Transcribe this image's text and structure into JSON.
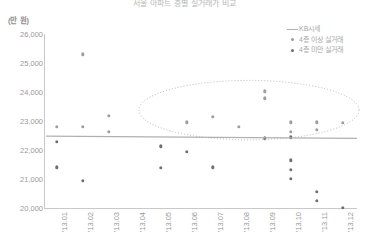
{
  "chart_data": {
    "type": "scatter",
    "title": "서울 아파트 층별 실거래가 비교",
    "unit_label": "(만 원)",
    "xlabel": "",
    "ylabel": "",
    "ylim": [
      20000,
      26000
    ],
    "ytick_values": [
      26000,
      25000,
      24000,
      23000,
      22000,
      21000,
      20000
    ],
    "ytick_labels": [
      "26,000",
      "25,000",
      "24,000",
      "23,000",
      "22,000",
      "21,000",
      "20,000"
    ],
    "categories": [
      "'13.01",
      "'13.02",
      "'13.03",
      "'13.04",
      "'13.05",
      "'13.06",
      "'13.07",
      "'13.08",
      "'13.09",
      "'13.10",
      "'13.11",
      "'13.12"
    ],
    "grid": false,
    "legend_position": "top-right",
    "legend": [
      {
        "label": "KB시세",
        "mark": "line",
        "color": "#b0b0b0"
      },
      {
        "label": "4층 이상 실거래",
        "mark": "dot",
        "color": "#9d9d9d"
      },
      {
        "label": "4층 미만 실거래",
        "mark": "dot",
        "color": "#6f6f6f"
      }
    ],
    "series": [
      {
        "name": "KB시세",
        "type": "line",
        "color": "#b0b0b0",
        "points": [
          {
            "x": "'13.01",
            "y": 22480
          },
          {
            "x": "'13.12",
            "y": 22400
          }
        ]
      },
      {
        "name": "4층 이상 실거래",
        "type": "scatter",
        "color": "#9d9d9d",
        "points": [
          {
            "x": "'13.01",
            "y": 22800
          },
          {
            "x": "'13.02",
            "y": 25300
          },
          {
            "x": "'13.02",
            "y": 22790
          },
          {
            "x": "'13.03",
            "y": 23180
          },
          {
            "x": "'13.03",
            "y": 22620
          },
          {
            "x": "'13.06",
            "y": 22950
          },
          {
            "x": "'13.07",
            "y": 23150
          },
          {
            "x": "'13.08",
            "y": 22810
          },
          {
            "x": "'13.09",
            "y": 24020
          },
          {
            "x": "'13.09",
            "y": 23780
          },
          {
            "x": "'13.10",
            "y": 22950
          },
          {
            "x": "'13.10",
            "y": 22620
          },
          {
            "x": "'13.11",
            "y": 22950
          },
          {
            "x": "'13.11",
            "y": 22700
          },
          {
            "x": "'13.12",
            "y": 22940
          }
        ]
      },
      {
        "name": "4층 미만 실거래",
        "type": "scatter",
        "color": "#6f6f6f",
        "points": [
          {
            "x": "'13.01",
            "y": 22280
          },
          {
            "x": "'13.01",
            "y": 21400
          },
          {
            "x": "'13.02",
            "y": 20930
          },
          {
            "x": "'13.05",
            "y": 22130
          },
          {
            "x": "'13.05",
            "y": 21380
          },
          {
            "x": "'13.06",
            "y": 21930
          },
          {
            "x": "'13.07",
            "y": 21400
          },
          {
            "x": "'13.09",
            "y": 22400
          },
          {
            "x": "'13.10",
            "y": 22440
          },
          {
            "x": "'13.10",
            "y": 21650
          },
          {
            "x": "'13.10",
            "y": 21320
          },
          {
            "x": "'13.10",
            "y": 21000
          },
          {
            "x": "'13.11",
            "y": 20550
          },
          {
            "x": "'13.11",
            "y": 20250
          },
          {
            "x": "'13.12",
            "y": 20000
          }
        ]
      }
    ],
    "annotations": [
      {
        "type": "ellipse",
        "style": "dotted",
        "color": "#b9b9b9",
        "x_range": [
          "'13.05",
          "'13.12"
        ],
        "y_range": [
          22350,
          24400
        ]
      }
    ]
  }
}
